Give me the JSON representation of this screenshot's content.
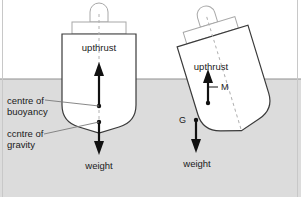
{
  "figure": {
    "colors": {
      "water": "#dcdcdc",
      "water_line": "#8f8f8f",
      "hull_outline": "#3a3a3a",
      "hull_fill": "#ffffff",
      "super_outline": "#a8a8a8",
      "arrow": "#111111",
      "leader": "#7a7a7a",
      "centerline": "#b0b0b0",
      "frame": "#c8c8c8",
      "text": "#1a1a1a"
    },
    "frame": {
      "visible": true
    }
  },
  "water": {
    "label": "water-surface",
    "waterline_y": 79
  },
  "left_ship": {
    "name": "upright-ship",
    "upthrust_label": "upthrust",
    "weight_label": "weight",
    "buoyancy_label_line1": "centre of",
    "buoyancy_label_line2": "buoyancy",
    "gravity_label_line1": "ccntre of",
    "gravity_label_line2": "gravity"
  },
  "right_ship": {
    "name": "heeled-ship",
    "upthrust_label": "upthrust",
    "weight_label": "weight",
    "metacentre_label": "M",
    "gravity_point_label": "G"
  }
}
